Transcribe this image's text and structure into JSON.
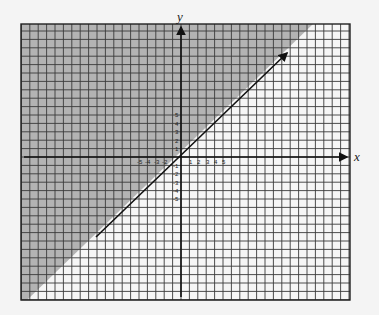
{
  "graph": {
    "x_axis_label": "x",
    "y_axis_label": "y",
    "x_tick_labels_neg": [
      "-5",
      "-4",
      "-3",
      "-2"
    ],
    "x_tick_labels_pos": [
      "1",
      "2",
      "3",
      "4",
      "5"
    ],
    "y_tick_labels_pos": [
      "5",
      "4",
      "3",
      "2",
      "1"
    ],
    "y_tick_labels_neg": [
      "-1",
      "-2",
      "-3",
      "-4",
      "-5"
    ],
    "line_equation": "y = x + 1",
    "shaded_region": "above line",
    "colors": {
      "shade": "#b3b3b3",
      "grid": "#333333",
      "background": "#f4f4f4",
      "line": "#111111"
    }
  }
}
